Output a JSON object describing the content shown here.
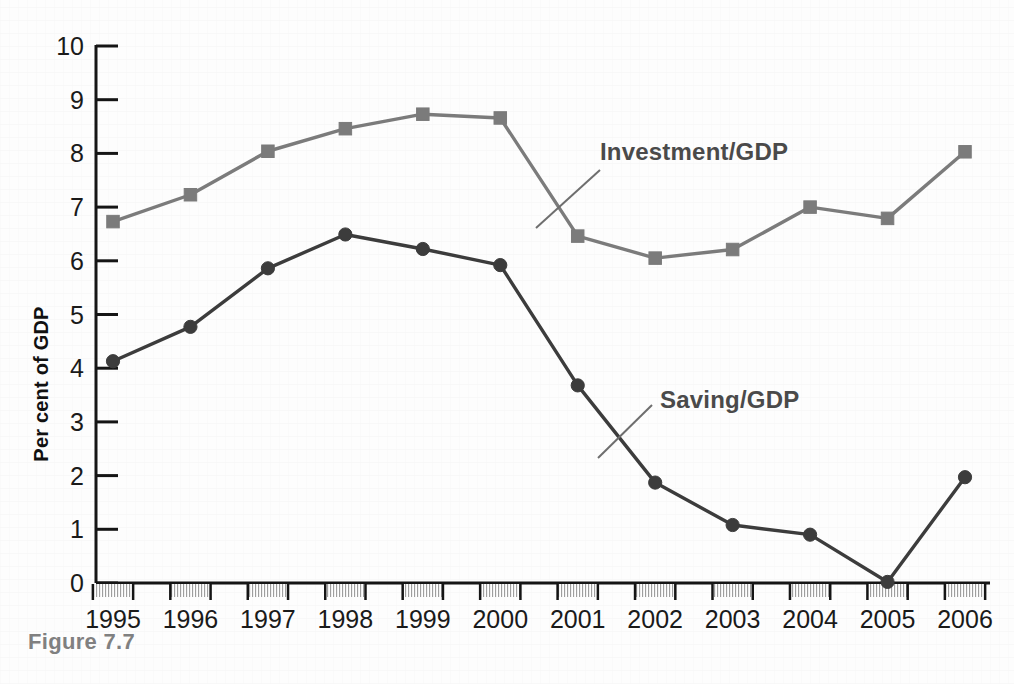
{
  "figure": {
    "caption": "Figure 7.7"
  },
  "chart_data": {
    "type": "line",
    "title": "",
    "subtitle": "",
    "xlabel": "",
    "ylabel": "Per cent of GDP",
    "x": [
      1995,
      1996,
      1997,
      1998,
      1999,
      2000,
      2001,
      2002,
      2003,
      2004,
      2005,
      2006
    ],
    "categories": [
      "1995",
      "1996",
      "1997",
      "1998",
      "1999",
      "2000",
      "2001",
      "2002",
      "2003",
      "2004",
      "2005",
      "2006"
    ],
    "ylim": [
      0,
      10
    ],
    "yticks": [
      0,
      1,
      2,
      3,
      4,
      5,
      6,
      7,
      8,
      9,
      10
    ],
    "ytick_labels": [
      "0",
      "1",
      "2",
      "3",
      "4",
      "5",
      "6",
      "7",
      "8",
      "9",
      "10"
    ],
    "grid": false,
    "legend_position": "inline-annotation",
    "series": [
      {
        "name": "Investment/GDP",
        "color": "#7b7b7b",
        "marker": "square",
        "values": [
          6.73,
          7.23,
          8.04,
          8.46,
          8.73,
          8.66,
          6.46,
          6.05,
          6.21,
          7.0,
          6.79,
          8.03
        ]
      },
      {
        "name": "Saving/GDP",
        "color": "#3c3c3c",
        "marker": "circle",
        "values": [
          4.13,
          4.77,
          5.86,
          6.49,
          6.22,
          5.92,
          3.68,
          1.87,
          1.08,
          0.9,
          0.02,
          1.97
        ]
      }
    ],
    "annotations": [
      {
        "text": "Investment/GDP",
        "target_series": "Investment/GDP",
        "label_x": 600,
        "label_y": 160
      },
      {
        "text": "Saving/GDP",
        "target_series": "Saving/GDP",
        "label_x": 660,
        "label_y": 408
      }
    ]
  },
  "colors": {
    "investment": "#7b7b7b",
    "saving": "#3c3c3c",
    "axis": "#151515",
    "caption": "#808080",
    "annotation_text": "#4a4a4a",
    "background": "#fdfdfd"
  }
}
